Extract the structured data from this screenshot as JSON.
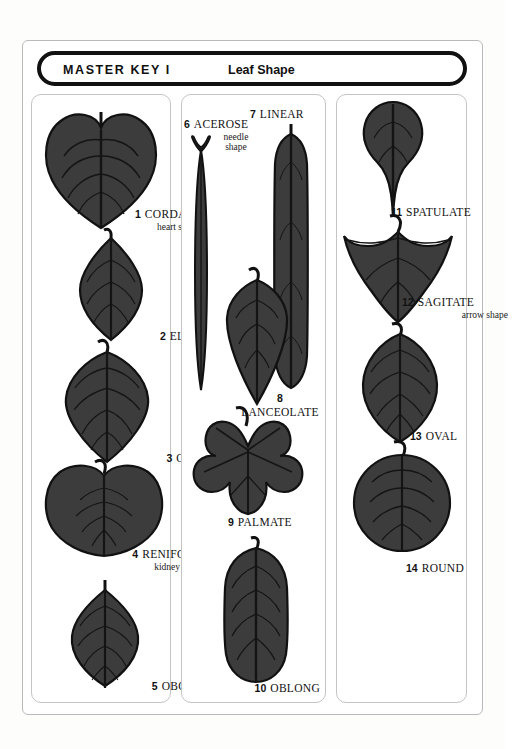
{
  "header": {
    "master_key": "MASTER  KEY  I",
    "subject": "Leaf Shape"
  },
  "colors": {
    "leaf_fill": "#3c3c3c",
    "leaf_outline": "#111111",
    "vein": "#141414",
    "frame": "#111111",
    "panel_border": "#c4c4c4",
    "page_background": "#ffffff"
  },
  "columns": [
    {
      "name": "column-1",
      "leaves": [
        {
          "num": "1",
          "name": "CORDATE",
          "sub": "heart shape"
        },
        {
          "num": "2",
          "name": "ELLIPTIC",
          "sub": ""
        },
        {
          "num": "3",
          "name": "OVATE",
          "sub": ""
        },
        {
          "num": "4",
          "name": "RENIFORM",
          "sub": "kidney shape"
        },
        {
          "num": "5",
          "name": "OBOVATE",
          "sub": ""
        }
      ]
    },
    {
      "name": "column-2",
      "leaves": [
        {
          "num": "6",
          "name": "ACEROSE",
          "sub": "needle\nshape"
        },
        {
          "num": "7",
          "name": "LINEAR",
          "sub": ""
        },
        {
          "num": "8",
          "name": "LANCEOLATE",
          "sub": ""
        },
        {
          "num": "9",
          "name": "PALMATE",
          "sub": ""
        },
        {
          "num": "10",
          "name": "OBLONG",
          "sub": ""
        }
      ]
    },
    {
      "name": "column-3",
      "leaves": [
        {
          "num": "11",
          "name": "SPATULATE",
          "sub": ""
        },
        {
          "num": "12",
          "name": "SAGITATE",
          "sub": "arrow shape"
        },
        {
          "num": "13",
          "name": "OVAL",
          "sub": ""
        },
        {
          "num": "14",
          "name": "ROUND",
          "sub": ""
        }
      ]
    }
  ],
  "captions": {
    "c1": {
      "num": "1",
      "name": "CORDATE",
      "sub": "heart shape"
    },
    "c2": {
      "num": "2",
      "name": "ELLIPTIC",
      "sub": ""
    },
    "c3": {
      "num": "3",
      "name": "OVATE",
      "sub": ""
    },
    "c4": {
      "num": "4",
      "name": "RENIFORM",
      "sub": "kidney shape"
    },
    "c5": {
      "num": "5",
      "name": "OBOVATE",
      "sub": ""
    },
    "c6": {
      "num": "6",
      "name": "ACEROSE",
      "sub1": "needle",
      "sub2": "shape"
    },
    "c7": {
      "num": "7",
      "name": "LINEAR",
      "sub": ""
    },
    "c8": {
      "num": "8",
      "name": "LANCEOLATE",
      "sub": ""
    },
    "c9": {
      "num": "9",
      "name": "PALMATE",
      "sub": ""
    },
    "c10": {
      "num": "10",
      "name": "OBLONG",
      "sub": ""
    },
    "c11": {
      "num": "11",
      "name": "SPATULATE",
      "sub": ""
    },
    "c12": {
      "num": "12",
      "name": "SAGITATE",
      "sub": "arrow shape"
    },
    "c13": {
      "num": "13",
      "name": "OVAL",
      "sub": ""
    },
    "c14": {
      "num": "14",
      "name": "ROUND",
      "sub": ""
    }
  }
}
